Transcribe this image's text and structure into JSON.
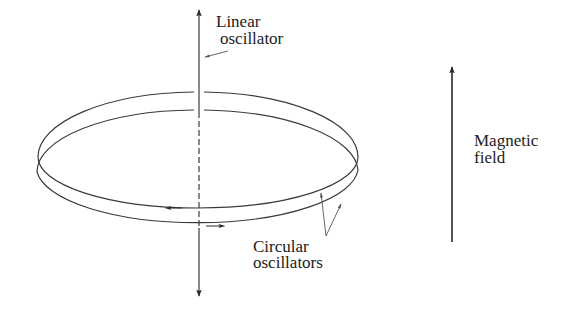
{
  "diagram": {
    "title": "",
    "colors": {
      "background": "#ffffff",
      "line": "#3a3a3a",
      "text": "#222222"
    },
    "labels": {
      "linear_oscillator": {
        "line1": "Linear",
        "line2": "oscillator"
      },
      "circular_oscillators": {
        "line1": "Circular",
        "line2": "oscillators"
      },
      "magnetic_field": {
        "line1": "Magnetic",
        "line2": "field"
      }
    },
    "elements": {
      "vertical_axis": "double-headed vertical arrow (linear oscillator)",
      "upper_ring": "ellipse with clockwise arrow (left-pointing at front)",
      "lower_ring": "ellipse with counter-clockwise arrow (right-pointing at front)",
      "field_arrow": "upward arrow (magnetic field)"
    }
  }
}
